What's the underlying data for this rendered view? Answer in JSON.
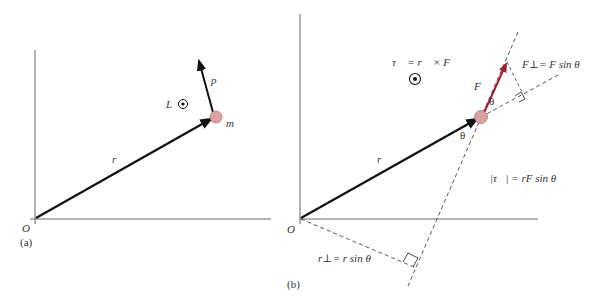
{
  "figure": {
    "panel_a": {
      "caption": "(a)",
      "origin_label": "O",
      "position_vector_label": "r⃗",
      "momentum_vector_label": "p⃗",
      "angular_momentum_label": "L⃗",
      "mass_label": "m",
      "out_of_page_symbol": "dot-in-circle"
    },
    "panel_b": {
      "caption": "(b)",
      "origin_label": "O",
      "position_vector_label": "r⃗",
      "force_vector_label": "F⃗",
      "torque_definition": "τ⃗ = r⃗ × F⃗",
      "force_perp_label": "F⊥= F sin θ",
      "lever_arm_label": "r⊥= r sin θ",
      "torque_magnitude": "|τ⃗| = rF sin θ",
      "angle_label_1": "θ",
      "angle_label_2": "θ",
      "out_of_page_symbol": "dot-in-circle"
    },
    "colors": {
      "vector": "#111111",
      "axis": "#666666",
      "force": "#a31d2a",
      "mass_fill": "#d9a3a6",
      "mass_stroke": "#b07a7e",
      "dashed": "#444444"
    }
  }
}
